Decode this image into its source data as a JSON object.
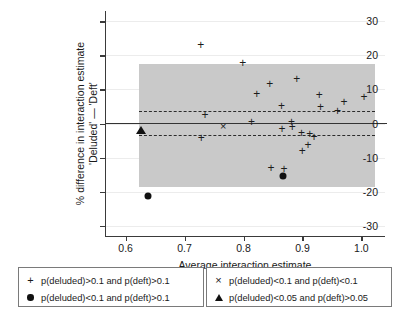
{
  "chart_data": {
    "type": "scatter",
    "title": "",
    "xlabel": "Average interaction estimate",
    "ylabel_line1": "% difference in interaction estimate",
    "ylabel_line2": "'Deluded' — 'Deft'",
    "xlim": [
      0.565,
      1.04
    ],
    "ylim": [
      -33,
      33
    ],
    "xticks": [
      0.6,
      0.7,
      0.8,
      0.9,
      1.0
    ],
    "xtick_labels": [
      "0.6",
      "0.7",
      "0.8",
      "0.9",
      "1.0"
    ],
    "yticks": [
      30,
      20,
      10,
      0,
      -10,
      -20,
      -30
    ],
    "ytick_labels": [
      "30",
      "20",
      "10",
      "0",
      "-10",
      "-20",
      "-30"
    ],
    "grid": true,
    "legend_position": "below-axes",
    "bias_line": 0.2,
    "upper_loa": 3.8,
    "lower_loa": -3.4,
    "shaded_band": {
      "x0": 0.623,
      "x1": 1.023,
      "y0": -18.5,
      "y1": 17.6,
      "color": "#c9c9c9"
    },
    "series": [
      {
        "name": "p(deluded)>0.1 and p(deft)>0.1",
        "marker": "plus",
        "points": [
          [
            0.7275,
            23.0
          ],
          [
            0.7985,
            17.8
          ],
          [
            0.8445,
            11.6
          ],
          [
            0.8905,
            13.1
          ],
          [
            0.8225,
            8.6
          ],
          [
            0.9285,
            8.3
          ],
          [
            0.9705,
            6.3
          ],
          [
            1.0045,
            7.9
          ],
          [
            0.8645,
            5.2
          ],
          [
            0.9305,
            4.9
          ],
          [
            0.9595,
            3.7
          ],
          [
            0.7345,
            2.4
          ],
          [
            0.8135,
            0.5
          ],
          [
            0.8815,
            0.3
          ],
          [
            0.8825,
            -0.9
          ],
          [
            0.8655,
            -1.6
          ],
          [
            0.8985,
            -2.8
          ],
          [
            0.9125,
            -3.1
          ],
          [
            0.9195,
            -3.9
          ],
          [
            0.7285,
            -4.2
          ],
          [
            0.9095,
            -6.2
          ],
          [
            0.8995,
            -8.2
          ],
          [
            0.8465,
            -13.1
          ],
          [
            0.8685,
            -13.3
          ]
        ]
      },
      {
        "name": "p(deluded)<0.1 and p(deft)<0.1",
        "marker": "cross",
        "points": [
          [
            0.7655,
            -0.6
          ]
        ]
      },
      {
        "name": "p(deluded)<0.1 and p(deft)>0.1",
        "marker": "dot",
        "points": [
          [
            0.6385,
            -21.3
          ],
          [
            0.8665,
            -15.4
          ]
        ]
      },
      {
        "name": "p(deluded)<0.05 and p(deft)>0.05",
        "marker": "triangle",
        "points": [
          [
            0.6255,
            -1.8
          ]
        ]
      }
    ]
  },
  "legend_left": {
    "rows": [
      {
        "symbol": "plus",
        "label": "p(deluded)>0.1 and p(deft)>0.1"
      },
      {
        "symbol": "dot",
        "label": "p(deluded)<0.1 and p(deft)>0.1"
      }
    ]
  },
  "legend_right": {
    "rows": [
      {
        "symbol": "cross",
        "label": "p(deluded)<0.1 and p(deft)<0.1"
      },
      {
        "symbol": "triangle",
        "label": "p(deluded)<0.05 and p(deft)>0.05"
      }
    ]
  },
  "symbols": {
    "plus": "+",
    "cross": "×"
  }
}
